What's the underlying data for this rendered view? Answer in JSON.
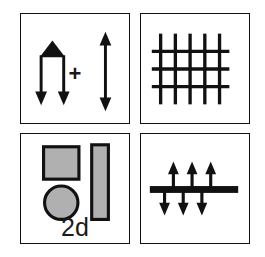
{
  "figure": {
    "background_color": "#ffffff",
    "stroke_color": "#111111",
    "fill_gray": "#b0b0b0",
    "panel_border_color": "#111111"
  },
  "panels": [
    {
      "id": "panel-top-left",
      "name": "pencil-and-double-arrow-panel",
      "position": "top-left",
      "elements": [
        {
          "name": "pencil-glyph",
          "description": "filled black triangular tip over two parallel vertical shafts",
          "arrows": [
            "down",
            "down"
          ],
          "arrow_count": 2,
          "tip_filled": true
        },
        {
          "name": "plus-operator",
          "symbol": "+"
        },
        {
          "name": "double-headed-vertical-arrow",
          "arrows": [
            "up",
            "down"
          ],
          "arrow_count": 1
        }
      ]
    },
    {
      "id": "panel-top-right",
      "name": "lattice-grid-panel",
      "position": "top-right",
      "elements": [
        {
          "name": "grid-mesh",
          "vertical_lines": 5,
          "horizontal_lines": 3,
          "line_weight": "thick"
        }
      ]
    },
    {
      "id": "panel-bottom-left",
      "name": "shapes-and-label-panel",
      "position": "bottom-left",
      "elements": [
        {
          "name": "gray-square",
          "fill": "#b0b0b0",
          "stroke": "#111111"
        },
        {
          "name": "gray-circle",
          "fill": "#b0b0b0",
          "stroke": "#111111"
        },
        {
          "name": "gray-tall-rectangle",
          "fill": "#b0b0b0",
          "stroke": "#111111"
        },
        {
          "name": "dimension-label",
          "text": "2d"
        }
      ]
    },
    {
      "id": "panel-bottom-right",
      "name": "bar-with-opposing-arrows-panel",
      "position": "bottom-right",
      "elements": [
        {
          "name": "horizontal-bar",
          "fill": "#111111"
        },
        {
          "name": "up-arrows-above-bar",
          "arrow_count": 3,
          "direction": "up"
        },
        {
          "name": "down-arrows-below-bar",
          "arrow_count": 3,
          "direction": "down"
        }
      ]
    }
  ],
  "labels": {
    "plus_symbol": "+",
    "dimension_2d": "2d"
  }
}
